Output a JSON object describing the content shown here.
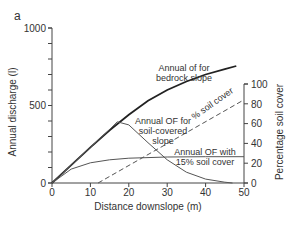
{
  "panel_label": "a",
  "chart_data": {
    "type": "line",
    "title": "",
    "xlabel": "Distance downslope (m)",
    "ylabel": "Annual discharge (l)",
    "ylabel_right": "Percentage soil cover",
    "xlim": [
      0,
      50
    ],
    "ylim": [
      0,
      1000
    ],
    "ylim_right": [
      0,
      100
    ],
    "x_ticks": [
      0,
      10,
      20,
      30,
      40,
      50
    ],
    "y_ticks_labeled": [
      0,
      500,
      1000
    ],
    "y_ticks_minor_step": 100,
    "y_right_ticks": [
      0,
      20,
      40,
      60,
      80,
      100
    ],
    "grid": false,
    "series": [
      {
        "name": "Annual of for bedrock slope",
        "axis": "left",
        "style": "solid-thick",
        "x": [
          0,
          5,
          10,
          15,
          20,
          25,
          30,
          35,
          40,
          45,
          48
        ],
        "y": [
          0,
          115,
          230,
          340,
          440,
          530,
          600,
          655,
          700,
          735,
          755
        ]
      },
      {
        "name": "Annual OF for soil-covered slope",
        "axis": "left",
        "style": "solid-thin",
        "x": [
          0,
          5,
          10,
          15,
          17,
          20,
          25,
          30,
          35,
          40,
          45,
          47
        ],
        "y": [
          0,
          115,
          230,
          345,
          395,
          375,
          260,
          150,
          70,
          25,
          5,
          0
        ]
      },
      {
        "name": "Annual OF with 15% soil cover",
        "axis": "left",
        "style": "solid-thin",
        "x": [
          0,
          5,
          10,
          15,
          20,
          30,
          40,
          50
        ],
        "y": [
          0,
          90,
          130,
          150,
          160,
          168,
          170,
          170
        ]
      },
      {
        "name": "% soil cover",
        "axis": "right",
        "style": "dashed",
        "x": [
          12,
          50
        ],
        "y": [
          0,
          84
        ]
      }
    ],
    "annotations": [
      {
        "text_lines": [
          "Annual of for",
          "bedrock slope"
        ],
        "x": 35,
        "y_left": 820
      },
      {
        "text_lines": [
          "Annual OF for",
          "soil-covered",
          "slope"
        ],
        "x": 25,
        "y_left": 420
      },
      {
        "text_lines": [
          "Annual OF with",
          "15% soil cover"
        ],
        "x": 42,
        "y_left": 230
      },
      {
        "text_lines": [
          "% soil cover"
        ],
        "x": 43,
        "y_right": 70,
        "rotated": true
      }
    ]
  },
  "labels": {
    "x_ticks": [
      "0",
      "10",
      "20",
      "30",
      "40",
      "50"
    ],
    "y_ticks": [
      "0",
      "500",
      "1000"
    ],
    "y_right_ticks": [
      "0",
      "20",
      "40",
      "60",
      "80",
      "100"
    ],
    "xlabel": "Distance downslope (m)",
    "ylabel": "Annual discharge (l)",
    "ylabel_right": "Percentage soil cover",
    "ann_bedrock_1": "Annual of for",
    "ann_bedrock_2": "bedrock slope",
    "ann_soil_1": "Annual OF for",
    "ann_soil_2": "soil-covered",
    "ann_soil_3": "slope",
    "ann_15_1": "Annual OF with",
    "ann_15_2": "15% soil cover",
    "ann_cover": "% soil cover"
  }
}
